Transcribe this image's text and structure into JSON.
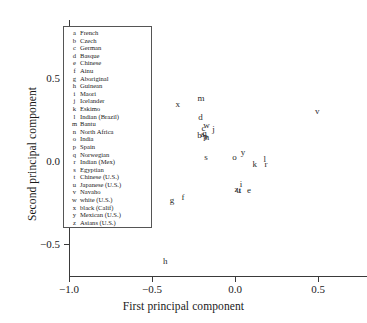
{
  "chart_data": {
    "type": "scatter",
    "title": "",
    "xlabel": "First principal component",
    "ylabel": "Second principal component",
    "xlim": [
      -1.05,
      0.72
    ],
    "ylim": [
      -0.72,
      0.68
    ],
    "xticks": [
      "-1.0",
      "-0.5",
      "0.0",
      "0.5"
    ],
    "xtick_values": [
      -1.0,
      -0.5,
      0.0,
      0.5
    ],
    "yticks": [
      "0.5",
      "0.0",
      "-0.5"
    ],
    "ytick_values": [
      0.5,
      0.0,
      -0.5
    ],
    "grid": false,
    "marker_style": "letter-label",
    "legend_position": "upper-left-inside",
    "points": [
      {
        "key": "m",
        "label": "Bantu",
        "x": -0.205,
        "y": 0.382
      },
      {
        "key": "x",
        "label": "black (Calif)",
        "x": -0.345,
        "y": 0.343
      },
      {
        "key": "d",
        "label": "Basque",
        "x": -0.208,
        "y": 0.265
      },
      {
        "key": "c",
        "label": "German",
        "x": -0.19,
        "y": 0.2
      },
      {
        "key": "w",
        "label": "white (U.S.)",
        "x": -0.172,
        "y": 0.214
      },
      {
        "key": "j",
        "label": "Icelander",
        "x": -0.13,
        "y": 0.19
      },
      {
        "key": "b",
        "label": "Czech",
        "x": -0.214,
        "y": 0.159
      },
      {
        "key": "a",
        "label": "French",
        "x": -0.196,
        "y": 0.165
      },
      {
        "key": "q",
        "label": "Norwegian",
        "x": -0.184,
        "y": 0.171
      },
      {
        "key": "p",
        "label": "Spain",
        "x": -0.178,
        "y": 0.153
      },
      {
        "key": "n",
        "label": "North Africa",
        "x": -0.169,
        "y": 0.147
      },
      {
        "key": "s",
        "label": "Egyptian",
        "x": -0.175,
        "y": 0.024
      },
      {
        "key": "o",
        "label": "India",
        "x": -0.003,
        "y": 0.024
      },
      {
        "key": "y",
        "label": "Mexican (U.S.)",
        "x": 0.048,
        "y": 0.057
      },
      {
        "key": "v",
        "label": "Navaho",
        "x": 0.495,
        "y": 0.301
      },
      {
        "key": "k",
        "label": "Eskimo",
        "x": 0.119,
        "y": -0.018
      },
      {
        "key": "l",
        "label": "Indian (Brazil)",
        "x": 0.18,
        "y": 0.012
      },
      {
        "key": "r",
        "label": "Indian (Mex)",
        "x": 0.186,
        "y": -0.018
      },
      {
        "key": "i",
        "label": "Maori",
        "x": 0.036,
        "y": -0.136
      },
      {
        "key": "z",
        "label": "Asians (U.S.)",
        "x": 0.009,
        "y": -0.166
      },
      {
        "key": "u",
        "label": "Japanese (U.S.)",
        "x": 0.021,
        "y": -0.172
      },
      {
        "key": "t",
        "label": "Chinese (U.S.)",
        "x": 0.03,
        "y": -0.172
      },
      {
        "key": "e",
        "label": "Chinese",
        "x": 0.084,
        "y": -0.172
      },
      {
        "key": "f",
        "label": "Ainu",
        "x": -0.313,
        "y": -0.217
      },
      {
        "key": "g",
        "label": "Aboriginal",
        "x": -0.38,
        "y": -0.232
      },
      {
        "key": "h",
        "label": "Guinean",
        "x": -0.42,
        "y": -0.604
      }
    ]
  },
  "legend": {
    "entries": [
      {
        "key": "a",
        "name": "French"
      },
      {
        "key": "b",
        "name": "Czech"
      },
      {
        "key": "c",
        "name": "German"
      },
      {
        "key": "d",
        "name": "Basque"
      },
      {
        "key": "e",
        "name": "Chinese"
      },
      {
        "key": "f",
        "name": "Ainu"
      },
      {
        "key": "g",
        "name": "Aboriginal"
      },
      {
        "key": "h",
        "name": "Guinean"
      },
      {
        "key": "i",
        "name": "Maori"
      },
      {
        "key": "j",
        "name": "Icelander"
      },
      {
        "key": "k",
        "name": "Eskimo"
      },
      {
        "key": "l",
        "name": "Indian (Brazil)"
      },
      {
        "key": "m",
        "name": "Bantu"
      },
      {
        "key": "n",
        "name": "North Africa"
      },
      {
        "key": "o",
        "name": "India"
      },
      {
        "key": "p",
        "name": "Spain"
      },
      {
        "key": "q",
        "name": "Norwegian"
      },
      {
        "key": "r",
        "name": "Indian (Mex)"
      },
      {
        "key": "s",
        "name": "Egyptian"
      },
      {
        "key": "t",
        "name": "Chinese (U.S.)"
      },
      {
        "key": "u",
        "name": "Japanese (U.S.)"
      },
      {
        "key": "v",
        "name": "Navaho"
      },
      {
        "key": "w",
        "name": "white (U.S.)"
      },
      {
        "key": "x",
        "name": "black (Calif)"
      },
      {
        "key": "y",
        "name": "Mexican (U.S.)"
      },
      {
        "key": "z",
        "name": "Asians (U.S.)"
      }
    ]
  },
  "colors": {
    "axis": "#3a3a3a",
    "text": "#1a1a1a",
    "point": "#2b2b2b",
    "legend_border": "#555555",
    "background": "#ffffff"
  }
}
